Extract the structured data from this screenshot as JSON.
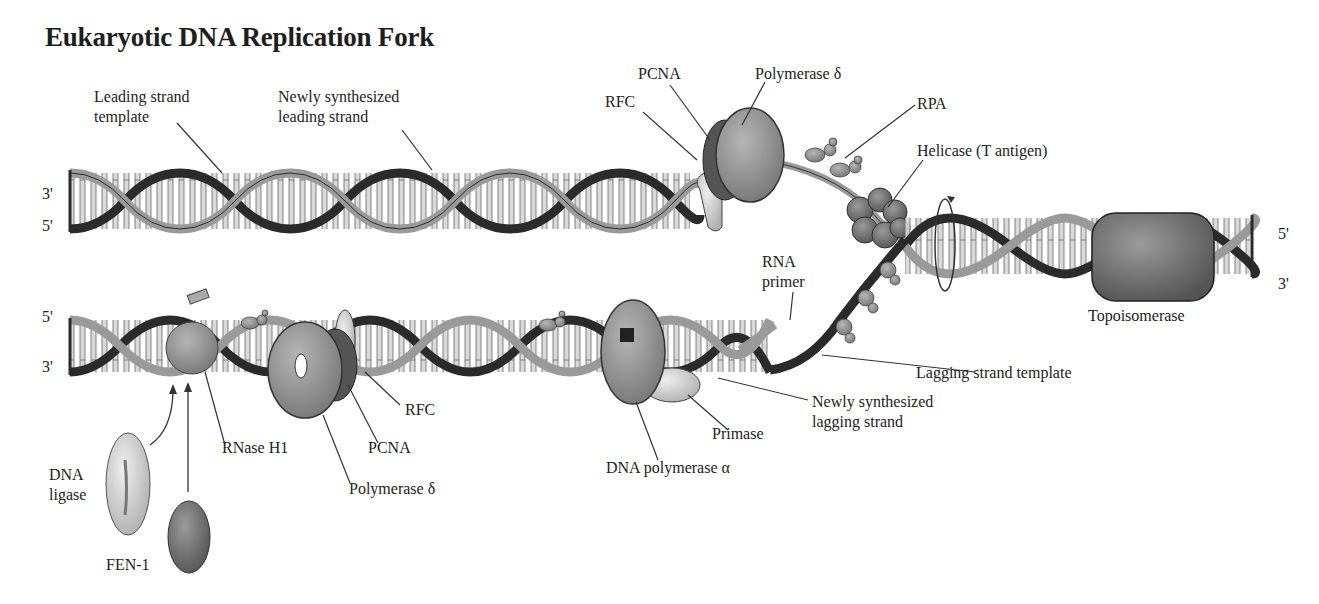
{
  "title": "Eukaryotic DNA Replication Fork",
  "colors": {
    "background": "#ffffff",
    "backbone_dark": "#2b2b2b",
    "backbone_light": "#9a9a9a",
    "base_pair": "#c8c8c8",
    "protein_dark": "#6e6e6e",
    "protein_mid": "#8c8c8c",
    "protein_light": "#b8b8b8",
    "text": "#222222"
  },
  "strand_ends": {
    "top_left_upper": "3'",
    "top_left_lower": "5'",
    "bottom_left_upper": "5'",
    "bottom_left_lower": "3'",
    "right_upper": "5'",
    "right_lower": "3'"
  },
  "labels": {
    "leading_strand_template": [
      "Leading strand",
      "template"
    ],
    "newly_synth_leading": [
      "Newly synthesized",
      "leading strand"
    ],
    "pcna_top": "PCNA",
    "polymerase_delta_top": "Polymerase δ",
    "rfc_top": "RFC",
    "rpa": "RPA",
    "helicase": "Helicase (T antigen)",
    "rna_primer": [
      "RNA",
      "primer"
    ],
    "topoisomerase": "Topoisomerase",
    "lagging_strand_template": "Lagging strand template",
    "newly_synth_lagging": [
      "Newly synthesized",
      "lagging strand"
    ],
    "primase": "Primase",
    "dna_polymerase_alpha": "DNA polymerase α",
    "rfc_bottom": "RFC",
    "pcna_bottom": "PCNA",
    "polymerase_delta_bottom": "Polymerase δ",
    "rnase_h1": "RNase H1",
    "dna_ligase": [
      "DNA",
      "ligase"
    ],
    "fen1": "FEN-1"
  }
}
